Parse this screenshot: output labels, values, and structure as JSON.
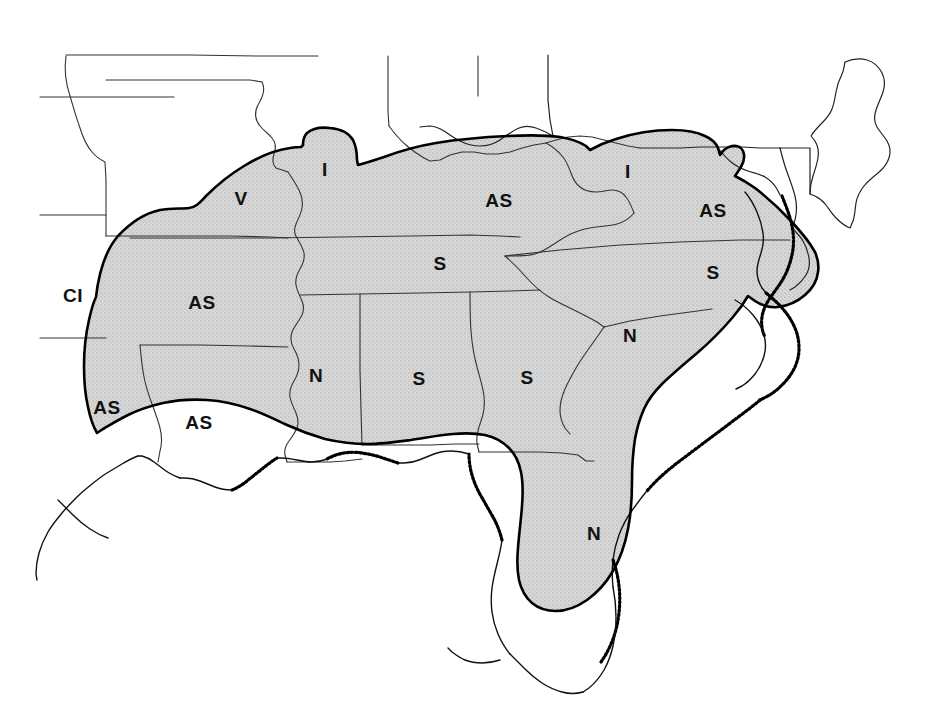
{
  "figure": {
    "kind": "distribution-map",
    "region_title": "Southeastern United States",
    "background_color": "#ffffff",
    "shaded_fill_color": "#d4d4d4",
    "outline_color": "#000000",
    "state_border_color": "#333333",
    "label_color": "#111111"
  },
  "legend_codes": [
    {
      "code": "AS",
      "count": 7
    },
    {
      "code": "S",
      "count": 5
    },
    {
      "code": "N",
      "count": 4
    },
    {
      "code": "I",
      "count": 2
    },
    {
      "code": "V",
      "count": 1
    },
    {
      "code": "CI",
      "count": 1
    }
  ],
  "labels": [
    {
      "id": "label-oklahoma-ci",
      "text": "CI",
      "x": 73,
      "y": 295,
      "inside_shaded": false
    },
    {
      "id": "label-texas-as",
      "text": "AS",
      "x": 107,
      "y": 407,
      "inside_shaded": true
    },
    {
      "id": "label-louisiana-as",
      "text": "AS",
      "x": 199,
      "y": 422,
      "inside_shaded": true
    },
    {
      "id": "label-arkansas-as",
      "text": "AS",
      "x": 202,
      "y": 302,
      "inside_shaded": true
    },
    {
      "id": "label-missouri-v",
      "text": "V",
      "x": 241,
      "y": 198,
      "inside_shaded": true
    },
    {
      "id": "label-illinois-i",
      "text": "I",
      "x": 325,
      "y": 169,
      "inside_shaded": true
    },
    {
      "id": "label-mississippi-n",
      "text": "N",
      "x": 316,
      "y": 375,
      "inside_shaded": true
    },
    {
      "id": "label-alabama-s",
      "text": "S",
      "x": 419,
      "y": 378,
      "inside_shaded": true
    },
    {
      "id": "label-tennessee-s",
      "text": "S",
      "x": 440,
      "y": 263,
      "inside_shaded": true
    },
    {
      "id": "label-kentucky-as",
      "text": "AS",
      "x": 499,
      "y": 200,
      "inside_shaded": true
    },
    {
      "id": "label-georgia-s",
      "text": "S",
      "x": 527,
      "y": 377,
      "inside_shaded": true
    },
    {
      "id": "label-westvirginia-i",
      "text": "I",
      "x": 628,
      "y": 171,
      "inside_shaded": true
    },
    {
      "id": "label-southcarolina-n",
      "text": "N",
      "x": 630,
      "y": 335,
      "inside_shaded": true
    },
    {
      "id": "label-florida-n",
      "text": "N",
      "x": 594,
      "y": 533,
      "inside_shaded": true
    },
    {
      "id": "label-virginia-as",
      "text": "AS",
      "x": 713,
      "y": 210,
      "inside_shaded": true
    },
    {
      "id": "label-northcarolina-s",
      "text": "S",
      "x": 713,
      "y": 272,
      "inside_shaded": true
    }
  ]
}
